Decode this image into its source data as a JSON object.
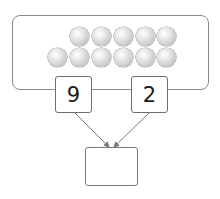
{
  "diagram": {
    "type": "number-bond",
    "counters": {
      "top_row_count": 5,
      "bottom_row_count": 6,
      "total": 11,
      "color": "#c4c4c4"
    },
    "parts": [
      {
        "value": "9"
      },
      {
        "value": "2"
      }
    ],
    "whole": {
      "value": ""
    },
    "colors": {
      "stroke": "#7a7a7a",
      "arrow": "#777777",
      "text": "#1a1a1a"
    }
  }
}
